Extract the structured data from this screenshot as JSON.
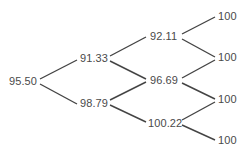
{
  "diagram": {
    "type": "binomial-tree",
    "levels": 4,
    "nodes": {
      "root": {
        "label": "95.50"
      },
      "l1_up": {
        "label": "91.33"
      },
      "l1_down": {
        "label": "98.79"
      },
      "l2_up": {
        "label": "92.11"
      },
      "l2_mid": {
        "label": "96.69"
      },
      "l2_down": {
        "label": "100.22"
      },
      "l3_0": {
        "label": "100"
      },
      "l3_1": {
        "label": "100"
      },
      "l3_2": {
        "label": "100"
      },
      "l3_3": {
        "label": "100"
      }
    },
    "edges": [
      [
        "root",
        "l1_up"
      ],
      [
        "root",
        "l1_down"
      ],
      [
        "l1_up",
        "l2_up"
      ],
      [
        "l1_up",
        "l2_mid"
      ],
      [
        "l1_down",
        "l2_mid"
      ],
      [
        "l1_down",
        "l2_down"
      ],
      [
        "l2_up",
        "l3_0"
      ],
      [
        "l2_up",
        "l3_1"
      ],
      [
        "l2_mid",
        "l3_1"
      ],
      [
        "l2_mid",
        "l3_2"
      ],
      [
        "l2_down",
        "l3_2"
      ],
      [
        "l2_down",
        "l3_3"
      ]
    ],
    "colors": {
      "line": "#444444",
      "text": "#4a4a4a",
      "background": "#ffffff"
    }
  }
}
